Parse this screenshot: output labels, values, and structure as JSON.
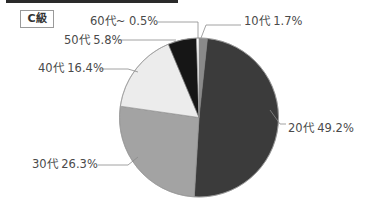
{
  "chart_data": {
    "type": "pie",
    "title": "C級",
    "categories": [
      "10代",
      "20代",
      "30代",
      "40代",
      "50代",
      "60代~"
    ],
    "values": [
      1.7,
      49.2,
      26.3,
      16.4,
      5.8,
      0.5
    ],
    "labels": [
      "10代 1.7%",
      "20代 49.2%",
      "30代 26.3%",
      "40代 16.4%",
      "50代 5.8%",
      "60代~ 0.5%"
    ],
    "colors": [
      "#8a8a8a",
      "#3b3b3b",
      "#a3a3a3",
      "#ececec",
      "#161616",
      "#ffffff"
    ],
    "start_angle_deg": 0,
    "direction": "clockwise",
    "legend": "none (leader-line labels)"
  },
  "badge": {
    "label": "C級"
  }
}
